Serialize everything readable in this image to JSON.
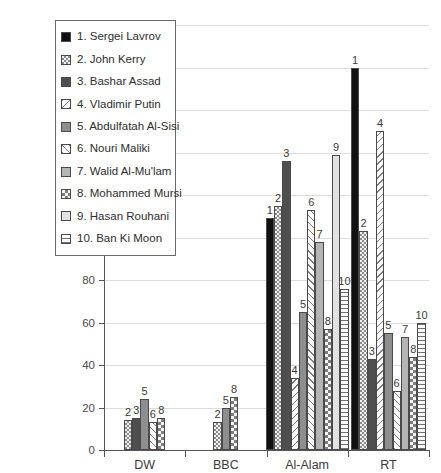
{
  "chart_data": {
    "type": "bar",
    "title": "",
    "subtitle": "",
    "xlabel": "",
    "ylabel": "",
    "ylim": [
      0,
      200
    ],
    "ytick_step": 20,
    "yticks": [
      0,
      20,
      40,
      60,
      80,
      100,
      120,
      140,
      160,
      180,
      200
    ],
    "ytick_labels": [
      "0",
      "20",
      "40",
      "60",
      "80",
      "100",
      "120",
      "140",
      "160",
      "180",
      "200"
    ],
    "grid": true,
    "grid_axis": "y",
    "legend_position": "upper-left-inside",
    "categories": [
      "DW",
      "BBC",
      "Al-Alam",
      "RT"
    ],
    "series": [
      {
        "num": "1",
        "name": "Sergei Lavrov",
        "pattern": "solid-black",
        "values": [
          null,
          null,
          109,
          180
        ]
      },
      {
        "num": "2",
        "name": "John Kerry",
        "pattern": "fine-check",
        "values": [
          14,
          13,
          115,
          103
        ]
      },
      {
        "num": "3",
        "name": "Bashar Assad",
        "pattern": "dark-gray",
        "values": [
          15,
          null,
          136,
          43
        ]
      },
      {
        "num": "4",
        "name": "Vladimir Putin",
        "pattern": "diag-back",
        "values": [
          null,
          null,
          34,
          150
        ]
      },
      {
        "num": "5",
        "name": "Abdulfatah Al-Sisi",
        "pattern": "mid-gray",
        "values": [
          24,
          20,
          65,
          55
        ]
      },
      {
        "num": "6",
        "name": "Nouri Maliki",
        "pattern": "diag-fwd",
        "values": [
          13,
          null,
          113,
          28
        ]
      },
      {
        "num": "7",
        "name": "Walid Al-Mu'lam",
        "pattern": "lightmid-gray",
        "values": [
          null,
          null,
          98,
          53
        ]
      },
      {
        "num": "8",
        "name": "Mohammed Mursi",
        "pattern": "check",
        "values": [
          15,
          25,
          57,
          44
        ]
      },
      {
        "num": "9",
        "name": "Hasan Rouhani",
        "pattern": "pale-gray",
        "values": [
          null,
          null,
          139,
          null
        ]
      },
      {
        "num": "10",
        "name": "Ban Ki Moon",
        "pattern": "horiz",
        "values": [
          null,
          null,
          76,
          60
        ]
      }
    ]
  },
  "legend": {
    "items": [
      {
        "label": "1. Sergei Lavrov"
      },
      {
        "label": "2. John Kerry"
      },
      {
        "label": "3. Bashar Assad"
      },
      {
        "label": "4. Vladimir Putin"
      },
      {
        "label": "5. Abdulfatah Al-Sisi"
      },
      {
        "label": "6. Nouri Maliki"
      },
      {
        "label": "7. Walid Al-Mu'lam"
      },
      {
        "label": "8. Mohammed Mursi"
      },
      {
        "label": "9. Hasan Rouhani"
      },
      {
        "label": "10. Ban Ki Moon"
      }
    ]
  },
  "colors": {
    "axis": "#555555",
    "grid": "#dcdcdc",
    "text": "#3a3a3a",
    "background": "#ffffff",
    "bar_outline": "#4a4a4a"
  }
}
